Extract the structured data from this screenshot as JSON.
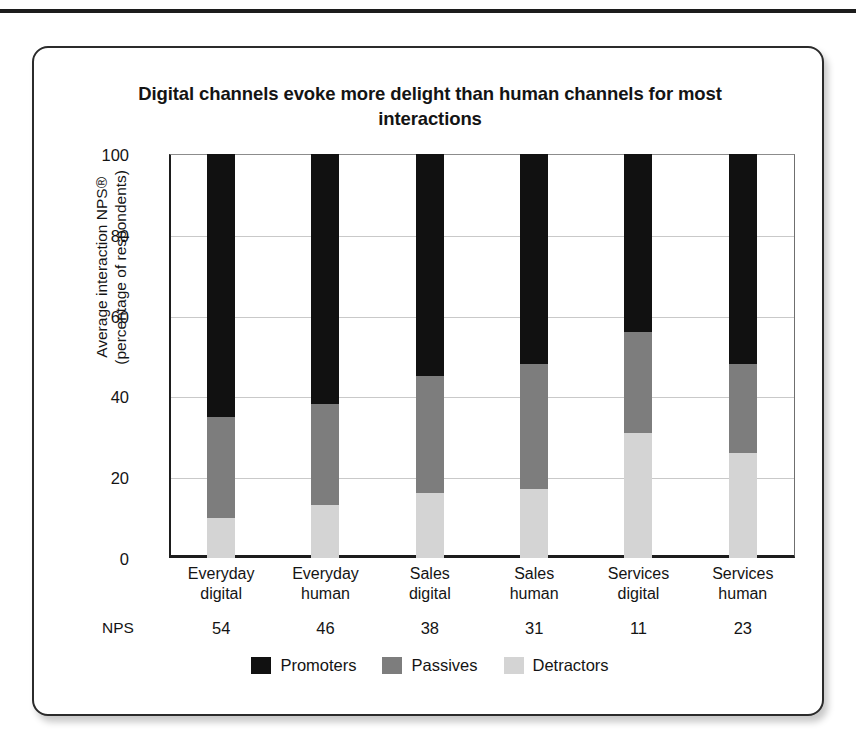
{
  "chart_data": {
    "type": "bar",
    "subtype": "stacked-100",
    "title": "Digital channels evoke more delight than human channels for most interactions",
    "xlabel": "",
    "ylabel": "Average interaction NPS® (percentage of respondents)",
    "ylim": [
      0,
      100
    ],
    "yticks": [
      0,
      20,
      40,
      60,
      80,
      100
    ],
    "grid": true,
    "legend_position": "bottom",
    "categories": [
      "Everyday digital",
      "Everyday human",
      "Sales digital",
      "Sales human",
      "Services digital",
      "Services human"
    ],
    "category_lines": [
      [
        "Everyday",
        "digital"
      ],
      [
        "Everyday",
        "human"
      ],
      [
        "Sales",
        "digital"
      ],
      [
        "Sales",
        "human"
      ],
      [
        "Services",
        "digital"
      ],
      [
        "Services",
        "human"
      ]
    ],
    "series": [
      {
        "name": "Promoters",
        "color": "#111111",
        "values": [
          65,
          62,
          55,
          52,
          44,
          52
        ]
      },
      {
        "name": "Passives",
        "color": "#7d7d7d",
        "values": [
          25,
          25,
          29,
          31,
          25,
          22
        ]
      },
      {
        "name": "Detractors",
        "color": "#d4d4d4",
        "values": [
          10,
          13,
          16,
          17,
          31,
          26
        ]
      }
    ],
    "annotations": {
      "nps_row_label": "NPS",
      "nps_values": [
        "54",
        "46",
        "38",
        "31",
        "11",
        "23"
      ]
    }
  },
  "yaxis": {
    "title_line1": "Average interaction NPS®",
    "title_line2": "(percentage of respondents)",
    "ticks": [
      "100",
      "80",
      "60",
      "40",
      "20",
      "0"
    ]
  },
  "legend": {
    "items": [
      {
        "label": "Promoters",
        "color": "#111111"
      },
      {
        "label": "Passives",
        "color": "#7d7d7d"
      },
      {
        "label": "Detractors",
        "color": "#d4d4d4"
      }
    ]
  }
}
